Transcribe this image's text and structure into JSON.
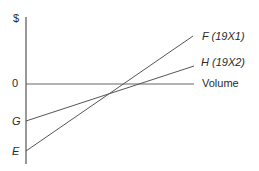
{
  "diagram": {
    "y_axis_label": "$",
    "zero_label": "0",
    "x_axis_label": "Volume",
    "intercepts": {
      "G": "G",
      "E": "E"
    },
    "lines": [
      {
        "id": "F",
        "label": "F  (19X1)",
        "start_intercept": "E"
      },
      {
        "id": "H",
        "label": "H  (19X2)",
        "start_intercept": "G"
      }
    ],
    "colors": {
      "line": "#555555",
      "text": "#2a2a2a"
    }
  }
}
